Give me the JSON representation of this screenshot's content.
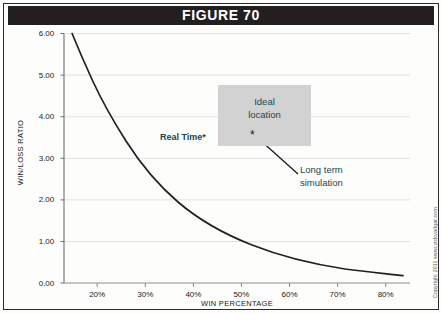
{
  "figure": {
    "title": "FIGURE 70",
    "copyright": "Copyright 2011 www.vickvadgar.com"
  },
  "chart_data": {
    "type": "line",
    "title": "FIGURE 70",
    "xlabel": "WIN PERCENTAGE",
    "ylabel": "WIN/LOSS RATIO",
    "xlim": [
      13,
      85
    ],
    "ylim": [
      0.0,
      6.0
    ],
    "grid": true,
    "legend": null,
    "xtick_labels": [
      "20%",
      "30%",
      "40%",
      "50%",
      "60%",
      "70%",
      "80%"
    ],
    "xtick_values": [
      20,
      30,
      40,
      50,
      60,
      70,
      80
    ],
    "ytick_labels": [
      "0.00",
      "1.00",
      "2.00",
      "3.00",
      "4.00",
      "5.00",
      "6.00"
    ],
    "ytick_values": [
      0.0,
      1.0,
      2.0,
      3.0,
      4.0,
      5.0,
      6.0
    ],
    "series": [
      {
        "name": "Break-even win/loss ratio",
        "formula": "ratio = (100 - win_pct) / win_pct",
        "x": [
          14.3,
          16,
          18,
          20,
          22,
          25,
          28,
          30,
          33,
          36,
          40,
          44,
          48,
          50,
          54,
          58,
          62,
          66,
          70,
          74,
          78,
          80,
          82
        ],
        "y": [
          6.0,
          5.25,
          4.56,
          4.0,
          3.55,
          3.0,
          2.57,
          2.33,
          2.03,
          1.78,
          1.5,
          1.27,
          1.08,
          1.0,
          0.85,
          0.72,
          0.61,
          0.52,
          0.43,
          0.35,
          0.28,
          0.25,
          0.22
        ]
      }
    ],
    "annotations": [
      {
        "name": "ideal-location",
        "text": "Ideal location",
        "lines": [
          "Ideal",
          "location"
        ],
        "shape": "shaded-rectangle",
        "x_range": [
          43,
          62
        ],
        "y_range": [
          2.85,
          4.25
        ]
      },
      {
        "name": "real-time",
        "text": "Real Time*",
        "x": 33,
        "y": 3.35
      },
      {
        "name": "long-term-simulation",
        "text": "Long term simulation",
        "lines": [
          "Long term",
          "simulation"
        ],
        "x": 60,
        "y": 2.5,
        "points_to": {
          "x": 50.5,
          "y": 3.3,
          "marker": "*"
        }
      }
    ]
  },
  "colors": {
    "header_bar": "#231f20",
    "header_text": "#ffffff",
    "curve": "#231f20",
    "gridline": "#e2e2e2",
    "axis": "#8c8c8c",
    "annotation_box": "#d2d2d2",
    "annotation_text": "#17494d",
    "frame": "#2b2b2b",
    "background": "#fdfdfc"
  }
}
